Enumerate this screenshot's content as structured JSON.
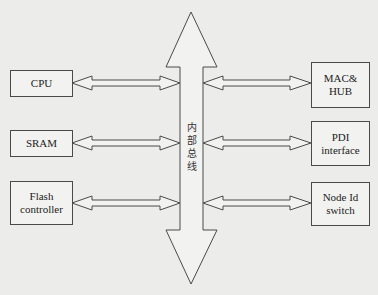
{
  "diagram": {
    "bus": {
      "label": "内\n部\n总\n线"
    },
    "left_modules": [
      {
        "label": "CPU"
      },
      {
        "label": "SRAM"
      },
      {
        "label": "Flash\ncontroller"
      }
    ],
    "right_modules": [
      {
        "label": "MAC&\nHUB"
      },
      {
        "label": "PDI\ninterface"
      },
      {
        "label": "Node Id\nswitch"
      }
    ],
    "connections": [
      {
        "from": "CPU",
        "to": "内部总线",
        "type": "bidirectional"
      },
      {
        "from": "SRAM",
        "to": "内部总线",
        "type": "bidirectional"
      },
      {
        "from": "Flash controller",
        "to": "内部总线",
        "type": "bidirectional"
      },
      {
        "from": "内部总线",
        "to": "MAC&HUB",
        "type": "bidirectional"
      },
      {
        "from": "内部总线",
        "to": "PDI interface",
        "type": "bidirectional"
      },
      {
        "from": "内部总线",
        "to": "Node Id switch",
        "type": "bidirectional"
      }
    ],
    "colors": {
      "line": "#4a4a4a",
      "background": "#ececea"
    }
  }
}
